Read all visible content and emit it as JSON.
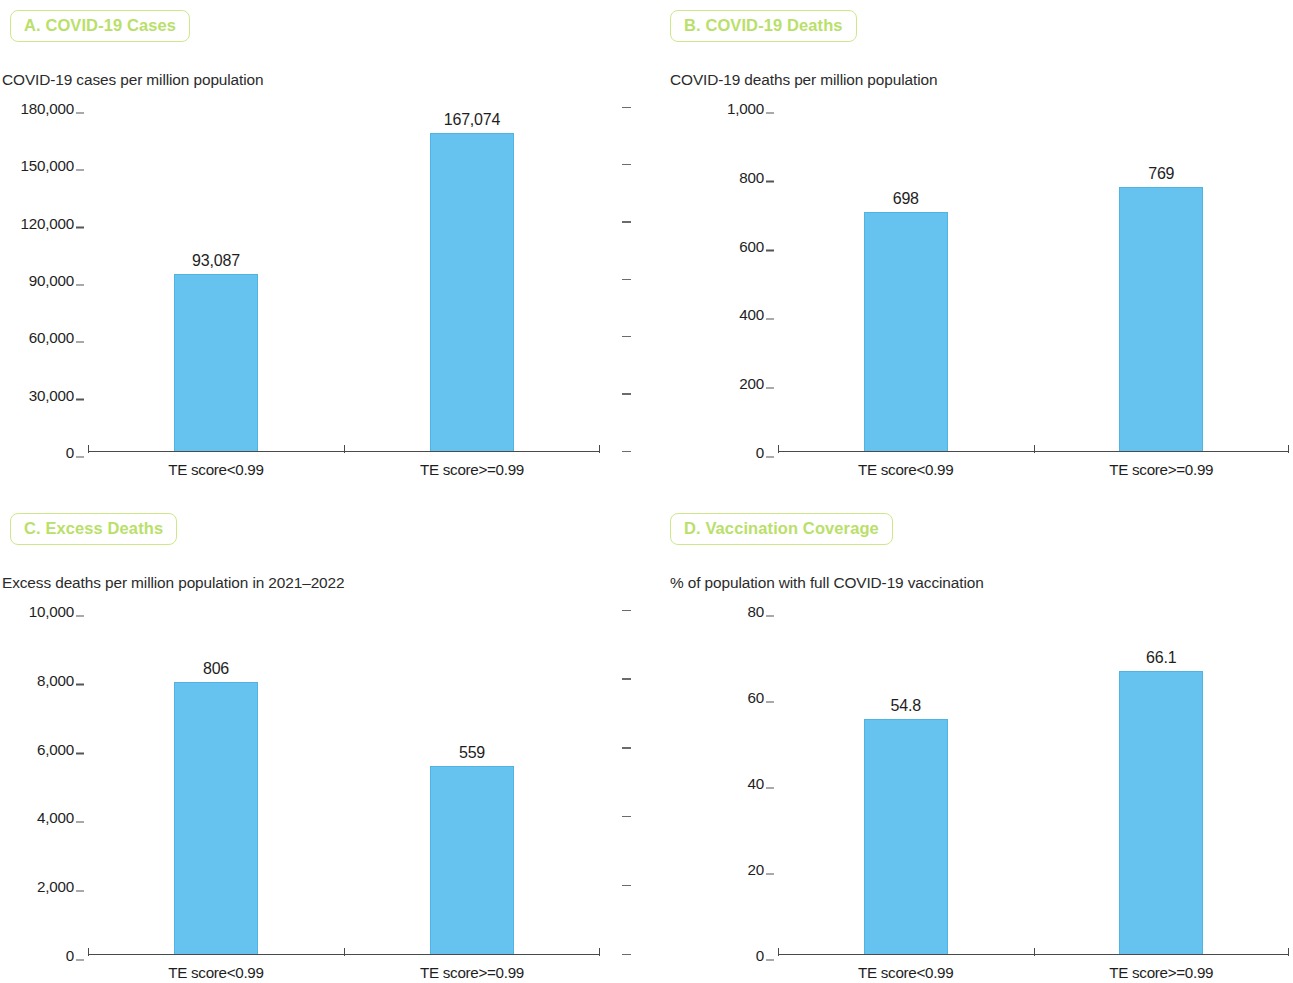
{
  "figure": {
    "bar_color": "#66c2ee",
    "badge_text_color": "#b9e06a",
    "badge_border_color": "#cde88a",
    "axis_color": "#4a4a4a"
  },
  "panels": [
    {
      "id": "a",
      "badge": "A. COVID-19 Cases",
      "subtitle": "COVID-19 cases per million population",
      "right_ticks": true,
      "chart_data": {
        "type": "bar",
        "title": "A. COVID-19 Cases",
        "subtitle": "COVID-19 cases per million population",
        "xlabel": "",
        "ylabel": "COVID-19 cases per million population",
        "categories": [
          "TE score<0.99",
          "TE score>=0.99"
        ],
        "values": [
          93087,
          167074
        ],
        "value_labels": [
          "93,087",
          "167,074"
        ],
        "plotted_fraction": [
          0.517,
          0.928
        ],
        "ylim": [
          0,
          180000
        ],
        "ytick_values": [
          0,
          30000,
          60000,
          90000,
          120000,
          150000,
          180000
        ],
        "ytick_labels": [
          "0",
          "30,000",
          "60,000",
          "90,000",
          "120,000",
          "150,000",
          "180,000"
        ],
        "grid": false,
        "legend": "none"
      }
    },
    {
      "id": "b",
      "badge": "B. COVID-19 Deaths",
      "subtitle": "COVID-19 deaths per million population",
      "right_ticks": false,
      "chart_data": {
        "type": "bar",
        "title": "B. COVID-19 Deaths",
        "subtitle": "COVID-19 deaths per million population",
        "xlabel": "",
        "ylabel": "COVID-19 deaths per million population",
        "categories": [
          "TE score<0.99",
          "TE score>=0.99"
        ],
        "values": [
          698,
          769
        ],
        "value_labels": [
          "698",
          "769"
        ],
        "plotted_fraction": [
          0.698,
          0.769
        ],
        "ylim": [
          0,
          1000
        ],
        "ytick_values": [
          0,
          200,
          400,
          600,
          800,
          1000
        ],
        "ytick_labels": [
          "0",
          "200",
          "400",
          "600",
          "800",
          "1,000"
        ],
        "grid": false,
        "legend": "none"
      }
    },
    {
      "id": "c",
      "badge": "C. Excess Deaths",
      "subtitle": "Excess deaths per million population in 2021–2022",
      "right_ticks": true,
      "chart_data": {
        "type": "bar",
        "title": "C. Excess Deaths",
        "subtitle": "Excess deaths per million population in 2021–2022",
        "xlabel": "",
        "ylabel": "Excess deaths per million population in 2021-2022",
        "categories": [
          "TE score<0.99",
          "TE score>=0.99"
        ],
        "values": [
          806,
          559
        ],
        "value_labels": [
          "806",
          "559"
        ],
        "plotted_fraction": [
          0.795,
          0.55
        ],
        "ylim": [
          0,
          10000
        ],
        "ytick_values": [
          0,
          2000,
          4000,
          6000,
          8000,
          10000
        ],
        "ytick_labels": [
          "0",
          "2,000",
          "4,000",
          "6,000",
          "8,000",
          "10,000"
        ],
        "grid": false,
        "legend": "none"
      }
    },
    {
      "id": "d",
      "badge": "D. Vaccination Coverage",
      "subtitle": "% of population with full COVID-19 vaccination",
      "right_ticks": false,
      "chart_data": {
        "type": "bar",
        "title": "D. Vaccination Coverage",
        "subtitle": "% of population with full COVID-19 vaccination",
        "xlabel": "",
        "ylabel": "% of population with full COVID-19 vaccination",
        "categories": [
          "TE score<0.99",
          "TE score>=0.99"
        ],
        "values": [
          54.8,
          66.1
        ],
        "value_labels": [
          "54.8",
          "66.1"
        ],
        "plotted_fraction": [
          0.685,
          0.826
        ],
        "ylim": [
          0,
          80
        ],
        "ytick_values": [
          0,
          20,
          40,
          60,
          80
        ],
        "ytick_labels": [
          "0",
          "20",
          "40",
          "60",
          "80"
        ],
        "grid": false,
        "legend": "none"
      }
    }
  ]
}
